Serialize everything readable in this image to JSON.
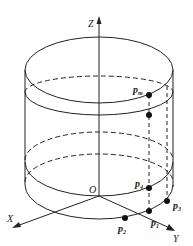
{
  "figure": {
    "type": "cylinder-with-coordinate-axes",
    "axes": {
      "x_label": "X",
      "y_label": "Y",
      "z_label": "Z",
      "origin_label": "O"
    },
    "points": [
      {
        "id": "pm",
        "label": "p",
        "sub": "m"
      },
      {
        "id": "p4",
        "label": "p",
        "sub": "4"
      },
      {
        "id": "p3",
        "label": "p",
        "sub": "3"
      },
      {
        "id": "p1",
        "label": "p",
        "sub": "1"
      },
      {
        "id": "p2",
        "label": "p",
        "sub": "2"
      }
    ],
    "colors": {
      "stroke": "#222222",
      "background": "#ffffff"
    }
  }
}
